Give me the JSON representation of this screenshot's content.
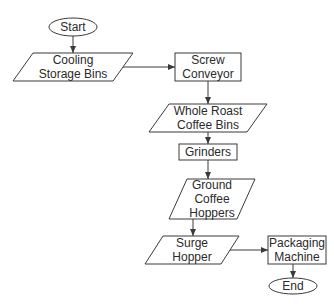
{
  "diagram": {
    "type": "flowchart",
    "colors": {
      "stroke": "#3a3a3a",
      "text": "#2a2a2a",
      "background": "#ffffff"
    },
    "nodes": [
      {
        "id": "start",
        "shape": "terminator",
        "lines": [
          "Start"
        ]
      },
      {
        "id": "cooling",
        "shape": "parallelogram",
        "lines": [
          "Cooling",
          "Storage Bins"
        ]
      },
      {
        "id": "screw",
        "shape": "rectangle",
        "lines": [
          "Screw",
          "Conveyor"
        ]
      },
      {
        "id": "whole",
        "shape": "parallelogram",
        "lines": [
          "Whole Roast",
          "Coffee Bins"
        ]
      },
      {
        "id": "grinders",
        "shape": "rectangle",
        "lines": [
          "Grinders"
        ]
      },
      {
        "id": "ground",
        "shape": "parallelogram",
        "lines": [
          "Ground",
          "Coffee",
          "Hoppers"
        ]
      },
      {
        "id": "surge",
        "shape": "parallelogram",
        "lines": [
          "Surge",
          "Hopper"
        ]
      },
      {
        "id": "packaging",
        "shape": "rectangle",
        "lines": [
          "Packaging",
          "Machine"
        ]
      },
      {
        "id": "end",
        "shape": "terminator",
        "lines": [
          "End"
        ]
      }
    ],
    "edges": [
      {
        "from": "start",
        "to": "cooling"
      },
      {
        "from": "cooling",
        "to": "screw"
      },
      {
        "from": "screw",
        "to": "whole"
      },
      {
        "from": "whole",
        "to": "grinders"
      },
      {
        "from": "grinders",
        "to": "ground"
      },
      {
        "from": "ground",
        "to": "surge"
      },
      {
        "from": "surge",
        "to": "packaging"
      },
      {
        "from": "packaging",
        "to": "end"
      }
    ]
  }
}
